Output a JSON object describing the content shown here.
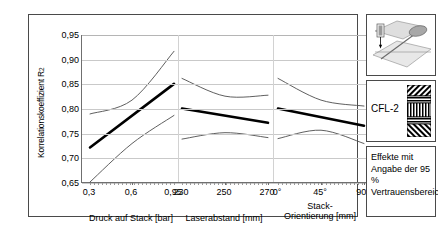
{
  "figure": {
    "y_axis_title": "Korrelationskoeffizient R",
    "y_axis_title_sup": "2",
    "y_ticks": [
      "0,95",
      "0,90",
      "0,85",
      "0,80",
      "0,75",
      "0,70",
      "0,65"
    ],
    "panels": [
      {
        "name": "druck-auf-stack",
        "caption": "Druck auf Stack [bar]",
        "caption_line2": "",
        "x_ticks": [
          "0,3",
          "0,6",
          "0,95"
        ]
      },
      {
        "name": "laserabstand",
        "caption": "Laserabstand [mm]",
        "caption_line2": "",
        "x_ticks": [
          "230",
          "250",
          "270"
        ]
      },
      {
        "name": "stack-orientierung",
        "caption": "Stack-",
        "caption_line2": "Orientierung [mm]",
        "x_ticks": [
          "0°",
          "45°",
          "90°"
        ]
      }
    ]
  },
  "side": {
    "specimen_label": "CFL-2",
    "legend_text": "Effekte mit Angabe der 95 % Vertrauensbereiche"
  },
  "caption_strip": "",
  "colors": {
    "frame": "#4a4a4a",
    "grid": "#c9c9c9",
    "effect_line": "#000000",
    "confidence_line": "#4d4d4d",
    "specimen_fill": "#000000"
  },
  "chart_data": {
    "type": "line",
    "title": "",
    "subtitle": "",
    "ylabel": "Korrelationskoeffizient R²",
    "xlabel": "",
    "ylim": [
      0.65,
      0.95
    ],
    "ytick_values": [
      0.95,
      0.9,
      0.85,
      0.8,
      0.75,
      0.7,
      0.65
    ],
    "grid": true,
    "legend": "Effekte mit Angabe der 95 % Vertrauensbereiche",
    "legend_position": "right-box",
    "panels": [
      {
        "name": "Druck auf Stack [bar]",
        "xlabel": "Druck auf Stack [bar]",
        "x": [
          0.3,
          0.6,
          0.95
        ],
        "series": [
          {
            "name": "Effekt",
            "values": [
              0.722,
              0.772,
              0.851
            ],
            "style": "bold"
          },
          {
            "name": "95 % Vertrauensbereich oben",
            "values": [
              0.79,
              0.818,
              0.917
            ],
            "style": "thin"
          },
          {
            "name": "95 % Vertrauensbereich unten",
            "values": [
              0.652,
              0.73,
              0.787
            ],
            "style": "thin"
          }
        ]
      },
      {
        "name": "Laserabstand [mm]",
        "xlabel": "Laserabstand [mm]",
        "x": [
          230,
          250,
          270
        ],
        "series": [
          {
            "name": "Effekt",
            "values": [
              0.801,
              0.787,
              0.772
            ],
            "style": "bold"
          },
          {
            "name": "95 % Vertrauensbereich oben",
            "values": [
              0.862,
              0.826,
              0.828
            ],
            "style": "thin"
          },
          {
            "name": "95 % Vertrauensbereich unten",
            "values": [
              0.739,
              0.752,
              0.742
            ],
            "style": "thin"
          }
        ]
      },
      {
        "name": "Stack-Orientierung [mm]",
        "xlabel": "Stack-Orientierung [mm]",
        "x": [
          0,
          45,
          90
        ],
        "series": [
          {
            "name": "Effekt",
            "values": [
              0.801,
              0.787,
              0.766
            ],
            "style": "bold"
          },
          {
            "name": "95 % Vertrauensbereich oben",
            "values": [
              0.862,
              0.818,
              0.806
            ],
            "style": "thin"
          },
          {
            "name": "95 % Vertrauensbereich unten",
            "values": [
              0.74,
              0.757,
              0.73
            ],
            "style": "thin"
          }
        ]
      }
    ]
  }
}
